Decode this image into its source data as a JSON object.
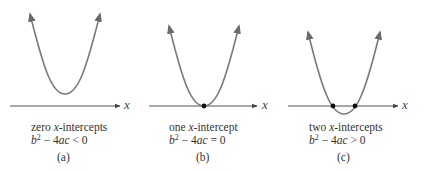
{
  "panels": [
    {
      "id": "a",
      "title_prefix": "zero ",
      "title_var": "x",
      "title_suffix": "-intercepts",
      "disc_b": "b",
      "disc_exp": "2",
      "disc_mid": " − 4",
      "disc_ac": "ac",
      "disc_rel": " < 0",
      "sublabel": "(a)",
      "axis_label": "x",
      "intercepts": 0
    },
    {
      "id": "b",
      "title_prefix": "one ",
      "title_var": "x",
      "title_suffix": "-intercept",
      "disc_b": "b",
      "disc_exp": "2",
      "disc_mid": " − 4",
      "disc_ac": "ac",
      "disc_rel": " = 0",
      "sublabel": "(b)",
      "axis_label": "x",
      "intercepts": 1
    },
    {
      "id": "c",
      "title_prefix": "two ",
      "title_var": "x",
      "title_suffix": "-intercepts",
      "disc_b": "b",
      "disc_exp": "2",
      "disc_mid": " − 4",
      "disc_ac": "ac",
      "disc_rel": " > 0",
      "sublabel": "(c)",
      "axis_label": "x",
      "intercepts": 2
    }
  ],
  "colors": {
    "curve": "#7a7a7a",
    "axis": "#555555",
    "point": "#111111"
  }
}
